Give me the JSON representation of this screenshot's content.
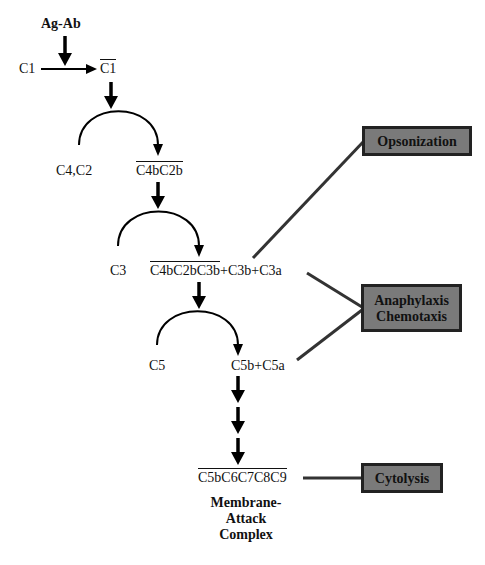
{
  "diagram": {
    "trigger": "Ag-Ab",
    "nodes": {
      "c1": "C1",
      "c1_active": "C1",
      "c4c2": "C4,C2",
      "c4bc2b": "C4bC2b",
      "c3": "C3",
      "c3_convertase": "C4bC2bC3b",
      "c3_products": "+C3b+C3a",
      "c5": "C5",
      "c5_products": "C5b+C5a",
      "mac": "C5bC6C7C8C9",
      "mac_label_1": "Membrane-",
      "mac_label_2": "Attack",
      "mac_label_3": "Complex"
    },
    "outcomes": {
      "opsonization": "Opsonization",
      "anaphylaxis": "Anaphylaxis",
      "chemotaxis": "Chemotaxis",
      "cytolysis": "Cytolysis"
    },
    "colors": {
      "box_fill": "#7a7a7a",
      "box_border": "#222222",
      "connector": "#333333",
      "arrow": "#000000"
    }
  }
}
